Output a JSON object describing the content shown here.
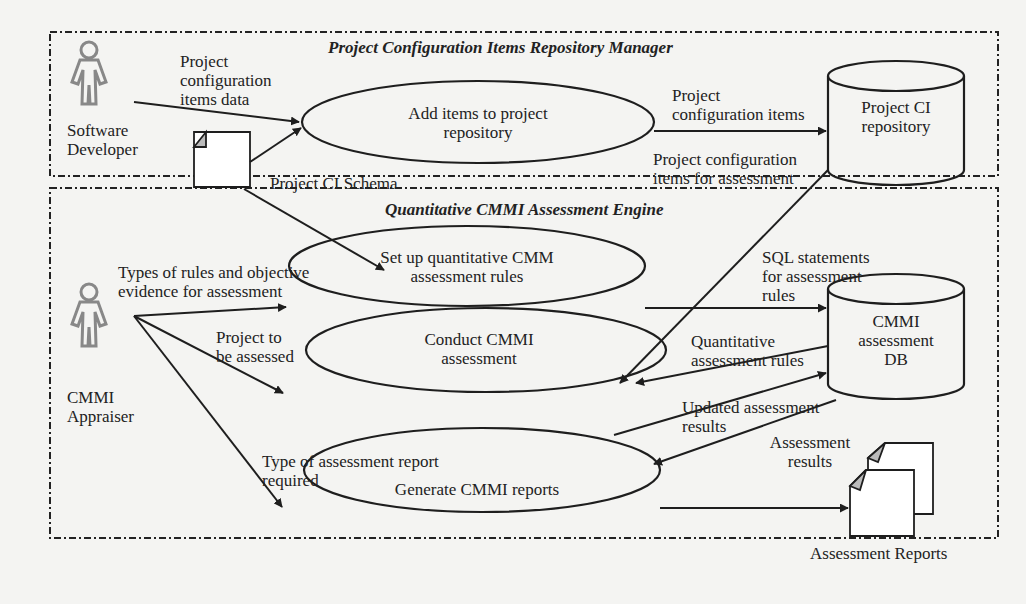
{
  "packages": {
    "top": {
      "title": "Project Configuration Items Repository Manager"
    },
    "bottom": {
      "title": "Quantitative CMMI Assessment Engine"
    }
  },
  "actors": {
    "developer": {
      "label_line1": "Software",
      "label_line2": "Developer"
    },
    "appraiser": {
      "label_line1": "CMMI",
      "label_line2": "Appraiser"
    }
  },
  "use_cases": {
    "add_items": {
      "line1": "Add items to project",
      "line2": "repository"
    },
    "setup_rules": {
      "line1": "Set up quantitative CMM",
      "line2": "assessment rules"
    },
    "conduct": {
      "line1": "Conduct CMMI",
      "line2": "assessment"
    },
    "generate": {
      "line1": "Generate CMMI reports"
    }
  },
  "datastores": {
    "project_ci": {
      "line1": "Project CI",
      "line2": "repository"
    },
    "cmmi_db": {
      "line1": "CMMI",
      "line2": "assessment",
      "line3": "DB"
    }
  },
  "documents": {
    "schema": {
      "label": "Project CI Schema"
    },
    "reports": {
      "label": "Assessment Reports"
    }
  },
  "flows": {
    "ci_data": {
      "line1": "Project",
      "line2": "configuration",
      "line3": "items data"
    },
    "ci_items": {
      "line1": "Project",
      "line2": "configuration items"
    },
    "ci_for_assessment": {
      "line1": "Project configuration",
      "line2": "items for assessment"
    },
    "rule_types": {
      "line1": "Types of rules and objective",
      "line2": "evidence for assessment"
    },
    "project_assessed": {
      "line1": "Project to",
      "line2": "be assessed"
    },
    "sql": {
      "line1": "SQL statements",
      "line2": "for assessment",
      "line3": "rules"
    },
    "quant_rules": {
      "line1": "Quantitative",
      "line2": "assessment rules"
    },
    "updated_results": {
      "line1": "Updated assessment",
      "line2": "results"
    },
    "assessment_results": {
      "line1": "Assessment",
      "line2": "results"
    },
    "report_type": {
      "line1": "Type of assessment report",
      "line2": "required"
    }
  }
}
